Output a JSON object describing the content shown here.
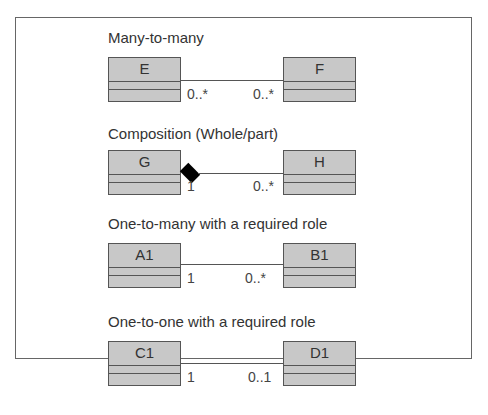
{
  "diagram": {
    "relationships": [
      {
        "title": "Many-to-many",
        "left_class": "E",
        "right_class": "F",
        "left_multiplicity": "0..*",
        "right_multiplicity": "0..*",
        "kind": "association"
      },
      {
        "title": "Composition (Whole/part)",
        "left_class": "G",
        "right_class": "H",
        "left_multiplicity": "1",
        "right_multiplicity": "0..*",
        "kind": "composition"
      },
      {
        "title": "One-to-many with a required role",
        "left_class": "A1",
        "right_class": "B1",
        "left_multiplicity": "1",
        "right_multiplicity": "0..*",
        "kind": "association"
      },
      {
        "title": "One-to-one with a required role",
        "left_class": "C1",
        "right_class": "D1",
        "left_multiplicity": "1",
        "right_multiplicity": "0..1",
        "kind": "association"
      }
    ],
    "colors": {
      "class_fill": "#c8c8c8",
      "border": "#555555",
      "text": "#333333",
      "composition_diamond": "#000000"
    }
  }
}
